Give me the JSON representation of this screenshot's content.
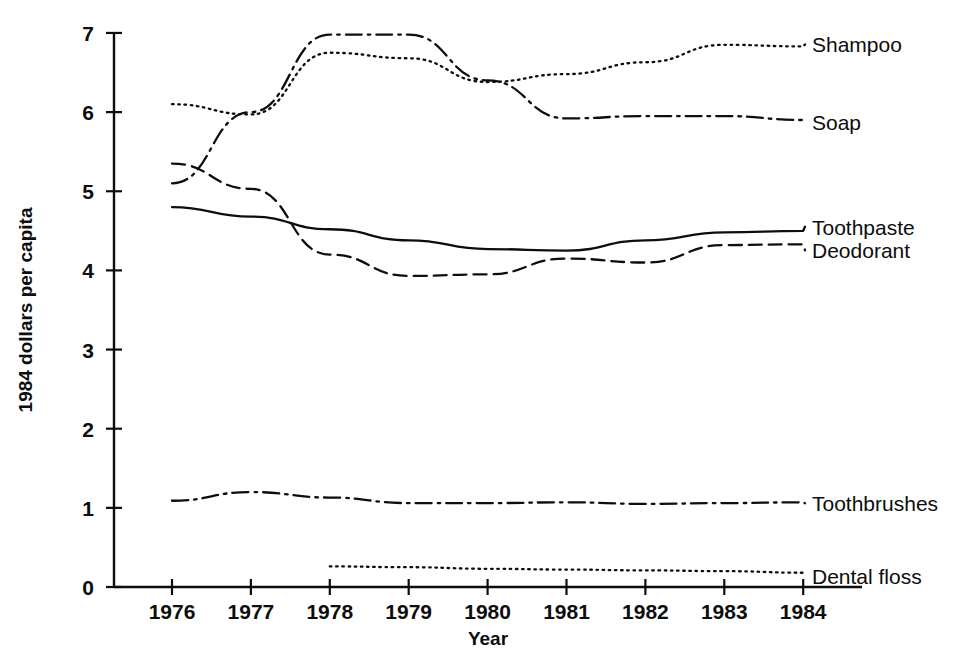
{
  "chart_data": {
    "type": "line",
    "title": "",
    "xlabel": "Year",
    "ylabel": "1984 dollars per capita",
    "x": [
      1976,
      1977,
      1978,
      1979,
      1980,
      1981,
      1982,
      1983,
      1984
    ],
    "xticklabels": [
      "1976",
      "1977",
      "1978",
      "1979",
      "1980",
      "1981",
      "1982",
      "1983",
      "1984"
    ],
    "yticklabels": [
      "0",
      "1",
      "2",
      "3",
      "4",
      "5",
      "6",
      "7"
    ],
    "xlim": [
      1975.85,
      1984.9
    ],
    "ylim": [
      0,
      7
    ],
    "grid": false,
    "legend_position": "right-inline-labels",
    "series": [
      {
        "name": "Shampoo",
        "style": "dotted",
        "label": "Shampoo",
        "x": [
          1976,
          1977,
          1978,
          1979,
          1980,
          1981,
          1982,
          1983,
          1984
        ],
        "values": [
          6.1,
          5.97,
          6.75,
          6.68,
          6.38,
          6.48,
          6.63,
          6.85,
          6.83
        ]
      },
      {
        "name": "Soap",
        "style": "dash-dot",
        "label": "Soap",
        "x": [
          1976,
          1977,
          1978,
          1979,
          1980,
          1981,
          1982,
          1983,
          1984
        ],
        "values": [
          5.1,
          6.0,
          6.98,
          6.98,
          6.4,
          5.92,
          5.95,
          5.95,
          5.9
        ]
      },
      {
        "name": "Toothpaste",
        "style": "solid",
        "label": "Toothpaste",
        "x": [
          1976,
          1977,
          1978,
          1979,
          1980,
          1981,
          1982,
          1983,
          1984
        ],
        "values": [
          4.8,
          4.68,
          4.52,
          4.38,
          4.27,
          4.25,
          4.38,
          4.48,
          4.5
        ]
      },
      {
        "name": "Deodorant",
        "style": "dashed",
        "label": "Deodorant",
        "x": [
          1976,
          1977,
          1978,
          1979,
          1980,
          1981,
          1982,
          1983,
          1984
        ],
        "values": [
          5.35,
          5.03,
          4.2,
          3.93,
          3.95,
          4.15,
          4.1,
          4.32,
          4.33
        ]
      },
      {
        "name": "Toothbrushes",
        "style": "dash-dot",
        "label": "Toothbrushes",
        "x": [
          1976,
          1977,
          1978,
          1979,
          1980,
          1981,
          1982,
          1983,
          1984
        ],
        "values": [
          1.09,
          1.2,
          1.13,
          1.06,
          1.06,
          1.07,
          1.05,
          1.06,
          1.07
        ]
      },
      {
        "name": "Dental floss",
        "style": "dotted",
        "label": "Dental floss",
        "x": [
          1978,
          1979,
          1980,
          1981,
          1982,
          1983,
          1984
        ],
        "values": [
          0.26,
          0.25,
          0.23,
          0.22,
          0.21,
          0.2,
          0.18
        ]
      }
    ]
  },
  "axes": {
    "y_title": "1984 dollars per capita",
    "x_title": "Year"
  }
}
